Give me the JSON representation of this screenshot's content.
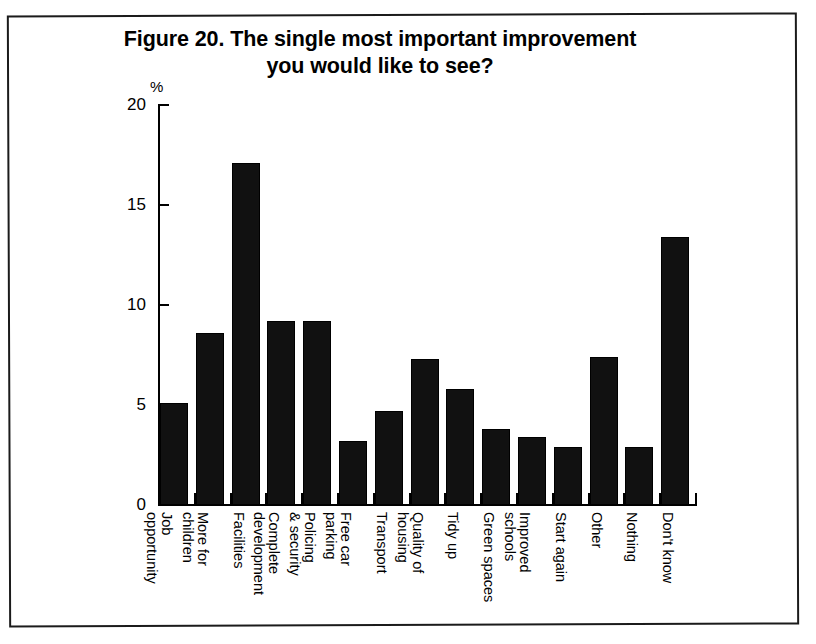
{
  "figure": {
    "title_line_1": "Figure 20. The single most important improvement",
    "title_line_2": "you would like to see?",
    "y_unit": "%"
  },
  "chart_data": {
    "type": "bar",
    "title": "Figure 20. The single most important improvement you would like to see?",
    "xlabel": "",
    "ylabel": "%",
    "ylim": [
      0,
      20
    ],
    "yticks": [
      0,
      5,
      10,
      15,
      20
    ],
    "ytick_labels": [
      "0",
      "5",
      "10",
      "15",
      "20"
    ],
    "grid": false,
    "legend": false,
    "bar_color": "#111111",
    "categories": [
      "Job opportunity",
      "More for children",
      "Facilities",
      "Complete development",
      "Policing & security",
      "Free car parking",
      "Transport",
      "Quality of housing",
      "Tidy up",
      "Green spaces",
      "Improved schools",
      "Start again",
      "Other",
      "Nothing",
      "Don't know"
    ],
    "category_lines": [
      [
        "Job",
        "opportunity"
      ],
      [
        "More for",
        "children"
      ],
      [
        "Facilities"
      ],
      [
        "Complete",
        "development"
      ],
      [
        "Policing",
        "& security"
      ],
      [
        "Free car",
        "parking"
      ],
      [
        "Transport"
      ],
      [
        "Quality of",
        "housing"
      ],
      [
        "Tidy up"
      ],
      [
        "Green spaces"
      ],
      [
        "Improved",
        "schools"
      ],
      [
        "Start again"
      ],
      [
        "Other"
      ],
      [
        "Nothing"
      ],
      [
        "Don't know"
      ]
    ],
    "values": [
      5.1,
      8.6,
      17.1,
      9.2,
      9.2,
      3.2,
      4.7,
      7.3,
      5.8,
      3.8,
      3.4,
      2.9,
      7.4,
      2.9,
      13.4
    ]
  }
}
